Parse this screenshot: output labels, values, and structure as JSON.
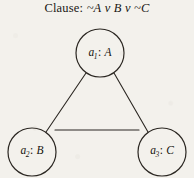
{
  "figure": {
    "title_prefix": "Clause:",
    "title_full": "Clause: ~A v B v ~C",
    "clause_literals": [
      "~A",
      "v",
      "B",
      "v",
      "~C"
    ],
    "background_color": "#f3f1ec",
    "ink_color": "#17140f"
  },
  "graph": {
    "nodes": [
      {
        "id": "a1",
        "label": "a1: A",
        "var_name": "a",
        "subscript": "1",
        "separator": ":",
        "literal": "A",
        "cx": 100,
        "cy": 53,
        "r": 24
      },
      {
        "id": "a2",
        "label": "a2: B",
        "var_name": "a",
        "subscript": "2",
        "separator": ":",
        "literal": "B",
        "cx": 32,
        "cy": 152,
        "r": 24
      },
      {
        "id": "a3",
        "label": "a3: C",
        "var_name": "a",
        "subscript": "3",
        "separator": ":",
        "literal": "C",
        "cx": 162,
        "cy": 152,
        "r": 24
      }
    ],
    "edges": [
      {
        "id": "e-a1-a2",
        "from": "a1",
        "to": "a2"
      },
      {
        "id": "e-a1-a3",
        "from": "a1",
        "to": "a3"
      },
      {
        "id": "e-a2-a3",
        "from": "a2",
        "to": "a3"
      }
    ]
  }
}
